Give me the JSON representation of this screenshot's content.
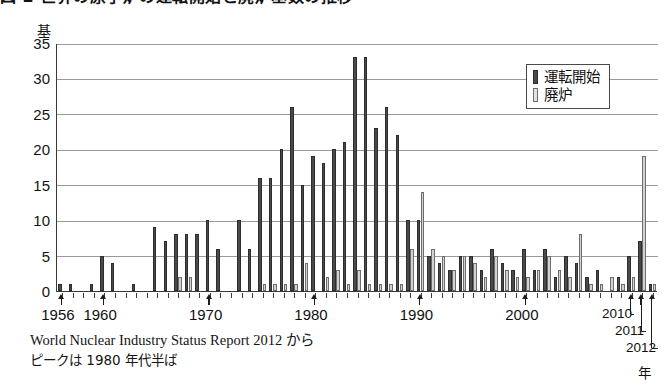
{
  "title": "図 2  世界の原子炉の運転開始と廃炉基数の推移",
  "unit_label": "基",
  "axis_year_label": "年",
  "legend": {
    "items": [
      {
        "key": "start",
        "label": "運転開始",
        "color": "#4a4a4a"
      },
      {
        "key": "shut",
        "label": "廃炉",
        "color": "#d2d2d2"
      }
    ]
  },
  "footer": {
    "source": "World Nuclear Industry Status Report 2012 から",
    "note": "ピークは 1980 年代半ば"
  },
  "callout_years": [
    "2010",
    "2011",
    "2012"
  ],
  "chart_data": {
    "type": "bar",
    "title": "図 2  世界の原子炉の運転開始と廃炉基数の推移",
    "xlabel": "年",
    "ylabel": "基",
    "ylim": [
      0,
      35
    ],
    "yticks": [
      0,
      5,
      10,
      15,
      20,
      25,
      30,
      35
    ],
    "grid": true,
    "legend_position": "top-right",
    "axis_tick_years": [
      "1956",
      "1960",
      "1970",
      "1980",
      "1990",
      "2000",
      "2010",
      "2011",
      "2012"
    ],
    "categories": [
      1956,
      1957,
      1958,
      1959,
      1960,
      1961,
      1962,
      1963,
      1964,
      1965,
      1966,
      1967,
      1968,
      1969,
      1970,
      1971,
      1972,
      1973,
      1974,
      1975,
      1976,
      1977,
      1978,
      1979,
      1980,
      1981,
      1982,
      1983,
      1984,
      1985,
      1986,
      1987,
      1988,
      1989,
      1990,
      1991,
      1992,
      1993,
      1994,
      1995,
      1996,
      1997,
      1998,
      1999,
      2000,
      2001,
      2002,
      2003,
      2004,
      2005,
      2006,
      2007,
      2008,
      2009,
      2010,
      2011,
      2012
    ],
    "series": [
      {
        "name": "運転開始",
        "color": "#4a4a4a",
        "values": [
          1,
          1,
          0,
          1,
          5,
          4,
          0,
          1,
          0,
          9,
          7,
          8,
          8,
          8,
          10,
          6,
          0,
          10,
          6,
          16,
          16,
          20,
          26,
          15,
          19,
          18,
          20,
          21,
          33,
          33,
          23,
          26,
          22,
          10,
          10,
          5,
          4,
          3,
          5,
          5,
          3,
          6,
          4,
          3,
          6,
          3,
          6,
          2,
          5,
          4,
          2,
          3,
          0,
          2,
          5,
          7,
          1
        ]
      },
      {
        "name": "廃炉",
        "color": "#d2d2d2",
        "values": [
          0,
          0,
          0,
          0,
          0,
          0,
          0,
          0,
          0,
          0,
          0,
          2,
          2,
          0,
          0,
          0,
          0,
          0,
          0,
          1,
          1,
          1,
          1,
          4,
          0,
          2,
          3,
          1,
          3,
          1,
          1,
          1,
          1,
          6,
          14,
          6,
          5,
          3,
          5,
          4,
          2,
          5,
          3,
          2,
          2,
          3,
          5,
          3,
          2,
          8,
          1,
          1,
          2,
          1,
          2,
          19,
          1
        ]
      }
    ]
  }
}
